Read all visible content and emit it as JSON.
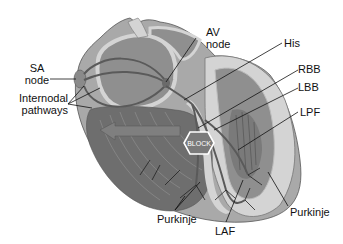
{
  "figure": {
    "style": "grayscale illustration"
  },
  "labels": {
    "sa_node": [
      "SA",
      "node"
    ],
    "internodal": [
      "Internodal",
      "pathways"
    ],
    "av_node": [
      "AV",
      "node"
    ],
    "his": "His",
    "rbb": "RBB",
    "lbb": "LBB",
    "lpf": "LPF",
    "purkinje_left": "Purkinje",
    "laf": "LAF",
    "purkinje_right": "Purkinje",
    "block": "BLOCK"
  },
  "colors": {
    "background": "#ffffff",
    "outer_wall": "#a9a9a9",
    "chamber_light": "#d4d4d4",
    "chamber_mid": "#8f8f8f",
    "ventricle_dark": "#6e6e6e",
    "pathway": "#5a5a5a",
    "leader_line": "#111111",
    "block_fill": "#7a7a7a",
    "block_border": "#ffffff"
  }
}
